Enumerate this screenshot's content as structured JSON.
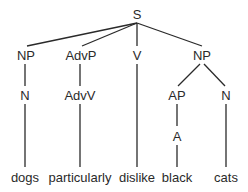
{
  "diagram": {
    "type": "syntax-tree",
    "colors": {
      "ink": "#2a2a2a",
      "background": "#ffffff"
    },
    "nodes": {
      "s": {
        "label": "S"
      },
      "np1": {
        "label": "NP"
      },
      "advp": {
        "label": "AdvP"
      },
      "v": {
        "label": "V"
      },
      "np2": {
        "label": "NP"
      },
      "n1": {
        "label": "N"
      },
      "advv": {
        "label": "AdvV"
      },
      "ap": {
        "label": "AP"
      },
      "n2": {
        "label": "N"
      },
      "a": {
        "label": "A"
      }
    },
    "words": {
      "dogs": "dogs",
      "particularly": "particularly",
      "dislike": "dislike",
      "black": "black",
      "cats": "cats"
    },
    "edges": [
      [
        "S",
        "NP"
      ],
      [
        "S",
        "AdvP"
      ],
      [
        "S",
        "V"
      ],
      [
        "S",
        "NP"
      ],
      [
        "NP",
        "N"
      ],
      [
        "AdvP",
        "AdvV"
      ],
      [
        "NP",
        "AP"
      ],
      [
        "NP",
        "N"
      ],
      [
        "AP",
        "A"
      ],
      [
        "N",
        "dogs"
      ],
      [
        "AdvV",
        "particularly"
      ],
      [
        "V",
        "dislike"
      ],
      [
        "A",
        "black"
      ],
      [
        "N",
        "cats"
      ]
    ]
  }
}
